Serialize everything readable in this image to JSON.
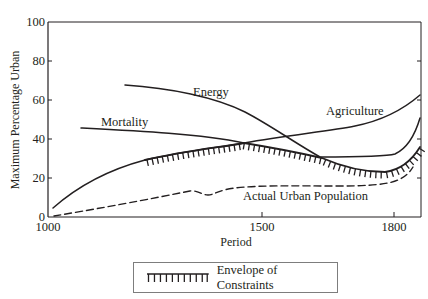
{
  "chart_data": {
    "type": "line",
    "title": "",
    "xlabel": "Period",
    "ylabel": "Maximum Percentage Urban",
    "xlim": [
      1000,
      1860
    ],
    "ylim": [
      0,
      100
    ],
    "x_ticks": [
      1000,
      1500,
      1800
    ],
    "y_ticks": [
      0,
      20,
      40,
      60,
      80,
      100
    ],
    "grid": false,
    "legend_position": "bottom-center",
    "series": [
      {
        "name": "Energy",
        "style": "solid",
        "points": [
          [
            1180,
            68
          ],
          [
            1300,
            65
          ],
          [
            1400,
            58
          ],
          [
            1500,
            50
          ],
          [
            1560,
            40
          ],
          [
            1620,
            30
          ],
          [
            1700,
            30
          ],
          [
            1780,
            31
          ],
          [
            1810,
            33
          ],
          [
            1840,
            40
          ],
          [
            1860,
            50
          ]
        ]
      },
      {
        "name": "Mortality",
        "style": "solid",
        "points": [
          [
            1080,
            46
          ],
          [
            1200,
            45
          ],
          [
            1300,
            43
          ],
          [
            1400,
            40
          ],
          [
            1450,
            38
          ]
        ]
      },
      {
        "name": "Agriculture",
        "style": "solid",
        "points": [
          [
            1010,
            5
          ],
          [
            1050,
            12
          ],
          [
            1100,
            18
          ],
          [
            1180,
            25
          ],
          [
            1250,
            29
          ],
          [
            1350,
            33
          ],
          [
            1450,
            37
          ],
          [
            1550,
            39
          ],
          [
            1650,
            43
          ],
          [
            1730,
            49
          ],
          [
            1800,
            55
          ],
          [
            1860,
            63
          ]
        ]
      },
      {
        "name": "Envelope of Constraints",
        "style": "hatched",
        "points": [
          [
            1250,
            29
          ],
          [
            1350,
            33
          ],
          [
            1450,
            38
          ],
          [
            1500,
            36
          ],
          [
            1550,
            34
          ],
          [
            1620,
            30
          ],
          [
            1680,
            26
          ],
          [
            1740,
            23
          ],
          [
            1790,
            22
          ],
          [
            1820,
            25
          ],
          [
            1845,
            30
          ],
          [
            1860,
            36
          ]
        ]
      },
      {
        "name": "Actual Urban Population",
        "style": "dashed",
        "points": [
          [
            1010,
            1
          ],
          [
            1080,
            3
          ],
          [
            1150,
            6
          ],
          [
            1250,
            10
          ],
          [
            1320,
            13
          ],
          [
            1345,
            11
          ],
          [
            1365,
            11
          ],
          [
            1400,
            14
          ],
          [
            1450,
            16
          ],
          [
            1550,
            16
          ],
          [
            1700,
            16
          ],
          [
            1780,
            17
          ],
          [
            1815,
            19
          ],
          [
            1840,
            24
          ],
          [
            1855,
            28
          ]
        ]
      }
    ],
    "annotations": [
      "Energy",
      "Mortality",
      "Agriculture",
      "Actual Urban Population"
    ]
  },
  "labels": {
    "y_ticks": [
      "0",
      "20",
      "40",
      "60",
      "80",
      "100"
    ],
    "x_ticks": [
      "1000",
      "1500",
      "1800"
    ],
    "xlabel": "Period",
    "ylabel": "Maximum Percentage Urban",
    "energy": "Energy",
    "mortality": "Mortality",
    "agriculture": "Agriculture",
    "actual": "Actual Urban Population",
    "legend": "Envelope of Constraints"
  }
}
